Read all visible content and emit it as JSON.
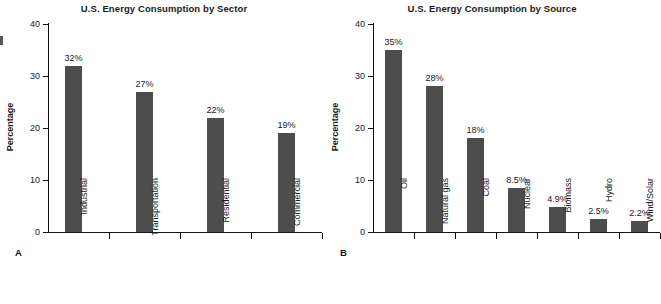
{
  "figure": {
    "panel_a_letter": "A",
    "panel_b_letter": "B"
  },
  "chart_data": [
    {
      "type": "bar",
      "panel": "A",
      "title": "U.S. Energy Consumption by Sector",
      "xlabel": "",
      "ylabel": "Percentage",
      "ylim": [
        0,
        40
      ],
      "yticks": [
        0,
        10,
        20,
        30,
        40
      ],
      "ytick_labels": [
        "0",
        "10",
        "20",
        "30",
        "40"
      ],
      "grid": false,
      "legend": false,
      "categories": [
        "Industrial",
        "Transportation",
        "Residential",
        "Commercial"
      ],
      "values": [
        32,
        27,
        22,
        19
      ],
      "value_labels": [
        "32%",
        "27%",
        "22%",
        "19%"
      ],
      "bar_color": "#4d4d4d"
    },
    {
      "type": "bar",
      "panel": "B",
      "title": "U.S. Energy Consumption by Source",
      "xlabel": "",
      "ylabel": "Percentage",
      "ylim": [
        0,
        40
      ],
      "yticks": [
        0,
        10,
        20,
        30,
        40
      ],
      "ytick_labels": [
        "0",
        "10",
        "20",
        "30",
        "40"
      ],
      "grid": false,
      "legend": false,
      "categories": [
        "Oil",
        "Natural gas",
        "Coal",
        "Nuclear",
        "Biomass",
        "Hydro",
        "Wind/Solar"
      ],
      "values": [
        35,
        28,
        18,
        8.5,
        4.9,
        2.5,
        2.2
      ],
      "value_labels": [
        "35%",
        "28%",
        "18%",
        "8.5%",
        "4.9%",
        "2.5%",
        "2.2%"
      ],
      "bar_color": "#4d4d4d"
    }
  ]
}
